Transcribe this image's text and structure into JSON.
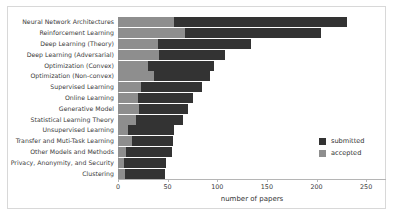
{
  "chart_data": {
    "type": "bar",
    "orientation": "horizontal",
    "stacked": true,
    "title": "",
    "xlabel": "number of papers",
    "ylabel": "",
    "xlim": [
      0,
      268
    ],
    "xticks": [
      0,
      50,
      100,
      150,
      200,
      250
    ],
    "xtick_labels": [
      "0",
      "50",
      "100",
      "150",
      "200",
      "250"
    ],
    "grid": false,
    "legend_position": "center right",
    "categories": [
      "Neural Network Architectures",
      "Reinforcement Learning",
      "Deep Learning (Theory)",
      "Deep Learning (Adversarial)",
      "Optimization (Convex)",
      "Optimization (Non-convex)",
      "Supervised Learning",
      "Online Learning",
      "Generative Model",
      "Statistical Learning Theory",
      "Unsupervised Learning",
      "Transfer and Muti-Task Learning",
      "Other Models and Methods",
      "Privacy, Anonymity, and Security",
      "Clustering"
    ],
    "series": [
      {
        "name": "accepted",
        "color": "#8e8e8e",
        "values": [
          56,
          68,
          40,
          41,
          30,
          36,
          23,
          20,
          21,
          18,
          10,
          14,
          8,
          6,
          7
        ]
      },
      {
        "name": "submitted",
        "color": "#333333",
        "values": [
          231,
          205,
          134,
          108,
          97,
          93,
          85,
          76,
          71,
          65,
          56,
          55,
          54,
          48,
          47
        ]
      }
    ]
  },
  "legend": {
    "items": [
      {
        "label": "submitted",
        "color": "#333333"
      },
      {
        "label": "accepted",
        "color": "#8e8e8e"
      }
    ]
  },
  "axis": {
    "x_title": "number of papers"
  },
  "colors": {
    "submitted": "#333333",
    "accepted": "#8e8e8e",
    "frame_border": "#d8d8d8",
    "axis": "#b5b5b5",
    "text": "#333333",
    "background": "#ffffff"
  }
}
